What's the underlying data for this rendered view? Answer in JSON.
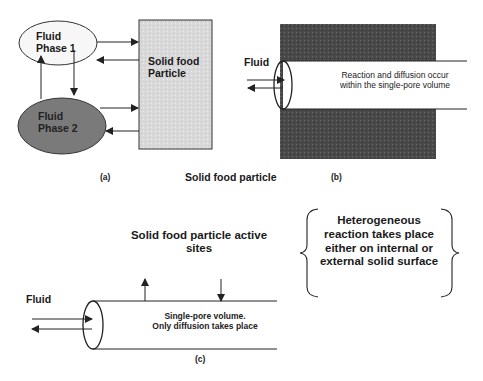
{
  "panel_a": {
    "label": "(a)",
    "fluid_phase_1": [
      "Fluid",
      "Phase 1"
    ],
    "fluid_phase_2": [
      "Fluid",
      "Phase 2"
    ],
    "solid_particle": [
      "Solid food",
      "Particle"
    ]
  },
  "shared_label": "Solid food particle",
  "panel_b": {
    "label": "(b)",
    "fluid": "Fluid",
    "pore_text": [
      "Reaction and diffusion occur",
      "within the single-pore volume"
    ]
  },
  "panel_c": {
    "label": "(c)",
    "fluid": "Fluid",
    "active_sites": [
      "Solid food particle active",
      "sites"
    ],
    "pore_text": [
      "Single-pore volume.",
      "Only diffusion takes place"
    ]
  },
  "brace_note": [
    "Heterogeneous",
    "reaction takes place",
    "either on internal or",
    "external solid surface"
  ],
  "colors": {
    "phase1_fill": "#f7f7f7",
    "phase2_fill": "#7a7a7a",
    "particle_fill": "#d9d9d9",
    "solid_dark": "#4a4a4a",
    "line": "#222222"
  }
}
